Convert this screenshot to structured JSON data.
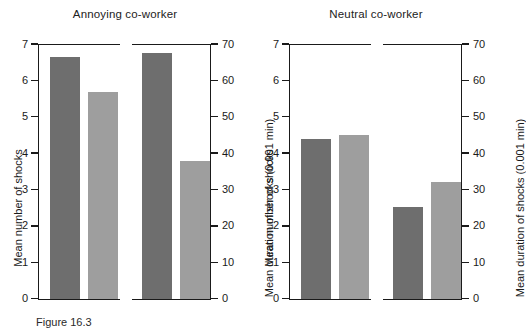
{
  "caption": "Figure 16.3",
  "colors": {
    "bar_dark": "#6e6e6e",
    "bar_light": "#9e9e9e",
    "axis": "#1a1a1a",
    "background": "#ffffff"
  },
  "panels": [
    {
      "key": "annoying",
      "title": "Annoying co-worker",
      "left_axis": {
        "label": "Mean number of shocks",
        "min": 0,
        "max": 7,
        "ticks": [
          0,
          1,
          2,
          3,
          4,
          5,
          6,
          7
        ],
        "tick_labels": [
          "0",
          "1",
          "2",
          "3",
          "4",
          "5",
          "6",
          "7"
        ]
      },
      "right_axis": {
        "label": "Mean duration of shocks (0.001 min)",
        "min": 0,
        "max": 70,
        "ticks": [
          0,
          10,
          20,
          30,
          40,
          50,
          60,
          70
        ],
        "tick_labels": [
          "0",
          "10",
          "20",
          "30",
          "40",
          "50",
          "60",
          "70"
        ]
      },
      "bars": [
        {
          "slot": "s1-dark",
          "shade": "dark",
          "axis": "left",
          "value": 6.65
        },
        {
          "slot": "s1-light",
          "shade": "light",
          "axis": "left",
          "value": 5.67
        },
        {
          "slot": "s2-dark",
          "shade": "dark",
          "axis": "right",
          "value": 67.5
        },
        {
          "slot": "s2-light",
          "shade": "light",
          "axis": "right",
          "value": 37.8
        }
      ]
    },
    {
      "key": "neutral",
      "title": "Neutral co-worker",
      "left_axis": {
        "label": "Mean number of shocks",
        "min": 0,
        "max": 7,
        "ticks": [
          0,
          1,
          2,
          3,
          4,
          5,
          6,
          7
        ],
        "tick_labels": [
          "0",
          "1",
          "2",
          "3",
          "4",
          "5",
          "6",
          "7"
        ]
      },
      "right_axis": {
        "label": "Mean duration of shocks (0.001 min)",
        "min": 0,
        "max": 70,
        "ticks": [
          0,
          10,
          20,
          30,
          40,
          50,
          60,
          70
        ],
        "tick_labels": [
          "0",
          "10",
          "20",
          "30",
          "40",
          "50",
          "60",
          "70"
        ]
      },
      "bars": [
        {
          "slot": "s1-dark",
          "shade": "dark",
          "axis": "left",
          "value": 4.4
        },
        {
          "slot": "s1-light",
          "shade": "light",
          "axis": "left",
          "value": 4.5
        },
        {
          "slot": "s2-dark",
          "shade": "dark",
          "axis": "right",
          "value": 25.2
        },
        {
          "slot": "s2-light",
          "shade": "light",
          "axis": "right",
          "value": 32.0
        }
      ]
    }
  ],
  "chart_data": {
    "type": "bar",
    "title": "",
    "panels": [
      "Annoying co-worker",
      "Neutral co-worker"
    ],
    "measures": [
      {
        "name": "Mean number of shocks",
        "axis": "left",
        "ylim": [
          0,
          7
        ],
        "yticks": [
          0,
          1,
          2,
          3,
          4,
          5,
          6,
          7
        ],
        "series": [
          {
            "name": "dark",
            "values": [
              6.65,
              4.4
            ]
          },
          {
            "name": "light",
            "values": [
              5.67,
              4.5
            ]
          }
        ]
      },
      {
        "name": "Mean duration of shocks (0.001 min)",
        "axis": "right",
        "ylim": [
          0,
          70
        ],
        "yticks": [
          0,
          10,
          20,
          30,
          40,
          50,
          60,
          70
        ],
        "series": [
          {
            "name": "dark",
            "values": [
              67.5,
              25.2
            ]
          },
          {
            "name": "light",
            "values": [
              37.8,
              32.0
            ]
          }
        ]
      }
    ],
    "categories": [
      "Annoying co-worker",
      "Neutral co-worker"
    ],
    "xlabel": "",
    "ylabel": "Mean number of shocks",
    "y2label": "Mean duration of shocks (0.001 min)",
    "grid": false,
    "legend": "none"
  }
}
